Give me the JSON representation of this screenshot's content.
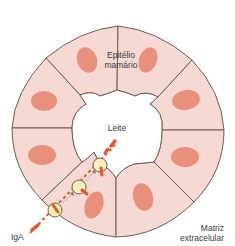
{
  "diagram": {
    "type": "cross-section",
    "labels": {
      "epithelium_line1": "Epitélio",
      "epithelium_line2": "mamário",
      "lumen": "Leite",
      "antibody": "IgA",
      "matrix_line1": "Matriz",
      "matrix_line2": "extracelular"
    },
    "cell_count": 8,
    "colors": {
      "cell_fill": "#f7d9d3",
      "cell_stroke": "#6b5e54",
      "nucleus": "#e8907c",
      "vesicle_fill": "#f6f1b8",
      "iga": "#e8542a",
      "arrow": "#8a7f76",
      "background": "#ffffff"
    }
  }
}
